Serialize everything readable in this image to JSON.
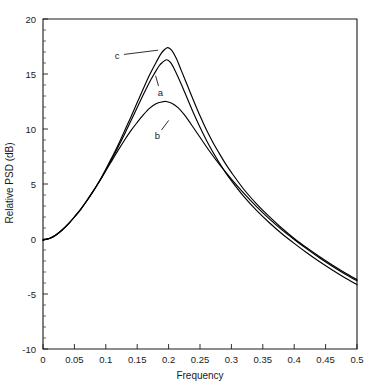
{
  "chart_data": {
    "type": "line",
    "title": "",
    "xlabel": "Frequency",
    "ylabel": "Relative PSD (dB)",
    "xlim": [
      0,
      0.5
    ],
    "ylim": [
      -10,
      20
    ],
    "grid": false,
    "legend": "inline-annotations",
    "xticks": [
      "0",
      "0.05",
      "0.1",
      "0.15",
      "0.2",
      "0.25",
      "0.3",
      "0.35",
      "0.4",
      "0.45",
      "0.5"
    ],
    "xtick_values": [
      0,
      0.05,
      0.1,
      0.15,
      0.2,
      0.25,
      0.3,
      0.35,
      0.4,
      0.45,
      0.5
    ],
    "yticks": [
      "20",
      "15",
      "10",
      "5",
      "0",
      "-5",
      "-10"
    ],
    "ytick_values": [
      20,
      15,
      10,
      5,
      0,
      -5,
      -10
    ],
    "ytick_minor_step": 1,
    "annotations": [
      {
        "label": "c",
        "x": 0.118,
        "y": 16.7,
        "target_x": 0.188,
        "target_y": 17.2
      },
      {
        "label": "a",
        "x": 0.187,
        "y": 13.3,
        "target_x": 0.178,
        "target_y": 15.1
      },
      {
        "label": "b",
        "x": 0.182,
        "y": 9.4,
        "target_x": 0.203,
        "target_y": 11.0
      }
    ],
    "series": [
      {
        "name": "a",
        "peak_frequency": 0.197,
        "peak_value": 16.3,
        "points": [
          [
            0.0,
            -0.1
          ],
          [
            0.01,
            0.05
          ],
          [
            0.02,
            0.35
          ],
          [
            0.03,
            0.8
          ],
          [
            0.04,
            1.35
          ],
          [
            0.05,
            2.0
          ],
          [
            0.06,
            2.7
          ],
          [
            0.07,
            3.5
          ],
          [
            0.08,
            4.35
          ],
          [
            0.09,
            5.25
          ],
          [
            0.1,
            6.25
          ],
          [
            0.11,
            7.3
          ],
          [
            0.12,
            8.4
          ],
          [
            0.13,
            9.55
          ],
          [
            0.14,
            10.75
          ],
          [
            0.15,
            11.95
          ],
          [
            0.16,
            13.15
          ],
          [
            0.17,
            14.3
          ],
          [
            0.178,
            15.1
          ],
          [
            0.185,
            15.75
          ],
          [
            0.19,
            16.05
          ],
          [
            0.197,
            16.3
          ],
          [
            0.203,
            16.05
          ],
          [
            0.21,
            15.35
          ],
          [
            0.22,
            14.1
          ],
          [
            0.23,
            12.75
          ],
          [
            0.24,
            11.4
          ],
          [
            0.25,
            10.15
          ],
          [
            0.26,
            9.0
          ],
          [
            0.27,
            7.95
          ],
          [
            0.28,
            7.0
          ],
          [
            0.29,
            6.1
          ],
          [
            0.3,
            5.3
          ],
          [
            0.32,
            3.85
          ],
          [
            0.34,
            2.6
          ],
          [
            0.36,
            1.5
          ],
          [
            0.38,
            0.5
          ],
          [
            0.4,
            -0.4
          ],
          [
            0.42,
            -1.25
          ],
          [
            0.44,
            -2.05
          ],
          [
            0.46,
            -2.8
          ],
          [
            0.48,
            -3.5
          ],
          [
            0.5,
            -4.15
          ]
        ]
      },
      {
        "name": "b",
        "peak_frequency": 0.196,
        "peak_value": 12.5,
        "points": [
          [
            0.0,
            -0.1
          ],
          [
            0.01,
            0.05
          ],
          [
            0.02,
            0.35
          ],
          [
            0.03,
            0.8
          ],
          [
            0.04,
            1.35
          ],
          [
            0.05,
            2.0
          ],
          [
            0.06,
            2.7
          ],
          [
            0.07,
            3.5
          ],
          [
            0.08,
            4.35
          ],
          [
            0.09,
            5.25
          ],
          [
            0.1,
            6.2
          ],
          [
            0.11,
            7.15
          ],
          [
            0.12,
            8.1
          ],
          [
            0.13,
            9.0
          ],
          [
            0.14,
            9.85
          ],
          [
            0.15,
            10.6
          ],
          [
            0.16,
            11.3
          ],
          [
            0.17,
            11.9
          ],
          [
            0.18,
            12.3
          ],
          [
            0.19,
            12.47
          ],
          [
            0.196,
            12.5
          ],
          [
            0.205,
            12.35
          ],
          [
            0.215,
            11.95
          ],
          [
            0.225,
            11.3
          ],
          [
            0.235,
            10.5
          ],
          [
            0.25,
            9.25
          ],
          [
            0.265,
            8.0
          ],
          [
            0.28,
            6.85
          ],
          [
            0.3,
            5.45
          ],
          [
            0.32,
            4.15
          ],
          [
            0.34,
            2.95
          ],
          [
            0.36,
            1.85
          ],
          [
            0.38,
            0.85
          ],
          [
            0.4,
            -0.05
          ],
          [
            0.42,
            -0.9
          ],
          [
            0.44,
            -1.7
          ],
          [
            0.46,
            -2.45
          ],
          [
            0.48,
            -3.15
          ],
          [
            0.5,
            -3.8
          ]
        ]
      },
      {
        "name": "c",
        "peak_frequency": 0.199,
        "peak_value": 17.4,
        "points": [
          [
            0.0,
            -0.1
          ],
          [
            0.01,
            0.05
          ],
          [
            0.02,
            0.35
          ],
          [
            0.03,
            0.8
          ],
          [
            0.04,
            1.35
          ],
          [
            0.05,
            2.0
          ],
          [
            0.06,
            2.7
          ],
          [
            0.07,
            3.5
          ],
          [
            0.08,
            4.35
          ],
          [
            0.09,
            5.3
          ],
          [
            0.1,
            6.35
          ],
          [
            0.11,
            7.45
          ],
          [
            0.12,
            8.6
          ],
          [
            0.13,
            9.85
          ],
          [
            0.14,
            11.1
          ],
          [
            0.15,
            12.4
          ],
          [
            0.16,
            13.7
          ],
          [
            0.17,
            14.95
          ],
          [
            0.18,
            16.05
          ],
          [
            0.188,
            16.85
          ],
          [
            0.194,
            17.25
          ],
          [
            0.199,
            17.4
          ],
          [
            0.205,
            17.15
          ],
          [
            0.212,
            16.45
          ],
          [
            0.22,
            15.35
          ],
          [
            0.23,
            13.95
          ],
          [
            0.24,
            12.55
          ],
          [
            0.25,
            11.2
          ],
          [
            0.26,
            9.95
          ],
          [
            0.27,
            8.85
          ],
          [
            0.28,
            7.85
          ],
          [
            0.29,
            6.9
          ],
          [
            0.3,
            6.05
          ],
          [
            0.32,
            4.5
          ],
          [
            0.34,
            3.2
          ],
          [
            0.36,
            2.05
          ],
          [
            0.38,
            1.0
          ],
          [
            0.4,
            0.05
          ],
          [
            0.42,
            -0.8
          ],
          [
            0.44,
            -1.6
          ],
          [
            0.46,
            -2.35
          ],
          [
            0.48,
            -3.05
          ],
          [
            0.5,
            -3.7
          ]
        ]
      }
    ]
  }
}
